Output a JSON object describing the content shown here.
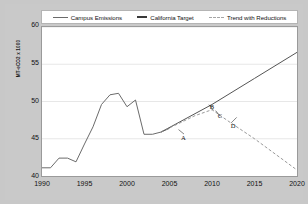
{
  "chart_data": {
    "type": "line",
    "title": "",
    "xlabel": "",
    "ylabel": "MT-eCO2 x 1000",
    "xlim": [
      1990,
      2020
    ],
    "ylim": [
      40,
      60
    ],
    "xticks": [
      1990,
      1995,
      2000,
      2005,
      2010,
      2015,
      2020
    ],
    "yticks": [
      40,
      45,
      50,
      55,
      60
    ],
    "grid": "horizontal",
    "legend_position": "top",
    "series": [
      {
        "name": "Campus Emissions",
        "style": "solid",
        "color": "#6b6b6b",
        "x": [
          1990,
          1991,
          1992,
          1993,
          1994,
          1995,
          1996,
          1997,
          1998,
          1999,
          2000,
          2001,
          2002,
          2003,
          2004,
          2005
        ],
        "values": [
          41.1,
          41.1,
          42.4,
          42.4,
          41.9,
          44.3,
          46.6,
          49.6,
          50.9,
          51.1,
          49.3,
          50.2,
          45.6,
          45.6,
          45.9,
          46.4
        ]
      },
      {
        "name": "California Target",
        "style": "solid",
        "color": "#555555",
        "x": [
          2004,
          2010,
          2015,
          2020
        ],
        "values": [
          45.9,
          49.6,
          53.1,
          56.6
        ]
      },
      {
        "name": "Trend with Reductions",
        "style": "dashed",
        "color": "#8f8f8f",
        "x": [
          2004,
          2008,
          2010,
          2012,
          2015,
          2020
        ],
        "values": [
          45.9,
          48.1,
          48.9,
          47.3,
          45.0,
          40.8
        ]
      }
    ],
    "annotations": [
      {
        "label": "A",
        "x": 2006.0,
        "y": 46.3
      },
      {
        "label": "B",
        "x": 2010.1,
        "y": 48.9
      },
      {
        "label": "C",
        "x": 2010.9,
        "y": 48.1
      },
      {
        "label": "D",
        "x": 2012.2,
        "y": 47.2
      }
    ]
  },
  "legend": {
    "items": [
      {
        "label": "Campus Emissions",
        "color": "#6b6b6b",
        "style": "solid"
      },
      {
        "label": "California Target",
        "color": "#3a3a3a",
        "style": "thick"
      },
      {
        "label": "Trend with Reductions",
        "color": "#a5a5a5",
        "style": "dashed"
      }
    ]
  }
}
